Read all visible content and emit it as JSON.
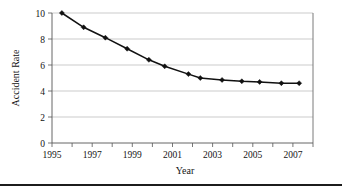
{
  "chart_data": {
    "type": "line",
    "title": "",
    "xlabel": "Year",
    "ylabel": "Accident Rate",
    "xlim": [
      1995,
      2008.2
    ],
    "ylim": [
      0,
      10
    ],
    "grid": true,
    "legend": null,
    "x_ticks": [
      1995,
      1996,
      1997,
      1998,
      1999,
      2000,
      2001,
      2002,
      2003,
      2004,
      2005,
      2006,
      2007,
      2008
    ],
    "x_tick_labels": [
      "1995",
      "",
      "1997",
      "",
      "1999",
      "",
      "2001",
      "",
      "2003",
      "",
      "2005",
      "",
      "2007",
      ""
    ],
    "x_labeled_ticks": [
      "1995",
      "1997",
      "1999",
      "2001",
      "2003",
      "2005",
      "2007"
    ],
    "y_ticks": [
      0,
      2,
      4,
      6,
      8,
      10
    ],
    "y_tick_labels": [
      "0",
      "2",
      "4",
      "6",
      "8",
      "10"
    ],
    "series": [
      {
        "name": "Accident Rate",
        "marker": "diamond",
        "color": "#111111",
        "x": [
          1995.55,
          1997.0,
          1998.6,
          2000.2,
          2001.8,
          2003.0,
          2004.6,
          2005.8,
          2006.9,
          2008.0,
          2009.0,
          2010.2,
          2011.2
        ],
        "values": [
          10.0,
          8.9,
          8.1,
          7.25,
          6.4,
          5.9,
          5.3,
          5.0,
          4.85,
          4.75,
          4.7,
          4.6,
          4.6
        ]
      }
    ],
    "points": [
      {
        "year": 1995.5,
        "rate": 10.0
      },
      {
        "year": 1996.6,
        "rate": 8.9
      },
      {
        "year": 1997.7,
        "rate": 8.1
      },
      {
        "year": 1998.8,
        "rate": 7.25
      },
      {
        "year": 1999.9,
        "rate": 6.4
      },
      {
        "year": 2000.7,
        "rate": 5.9
      },
      {
        "year": 2001.9,
        "rate": 5.3
      },
      {
        "year": 2002.5,
        "rate": 5.0
      },
      {
        "year": 2003.6,
        "rate": 4.85
      },
      {
        "year": 2004.6,
        "rate": 4.75
      },
      {
        "year": 2005.5,
        "rate": 4.7
      },
      {
        "year": 2006.6,
        "rate": 4.6
      },
      {
        "year": 2007.5,
        "rate": 4.6
      }
    ]
  }
}
